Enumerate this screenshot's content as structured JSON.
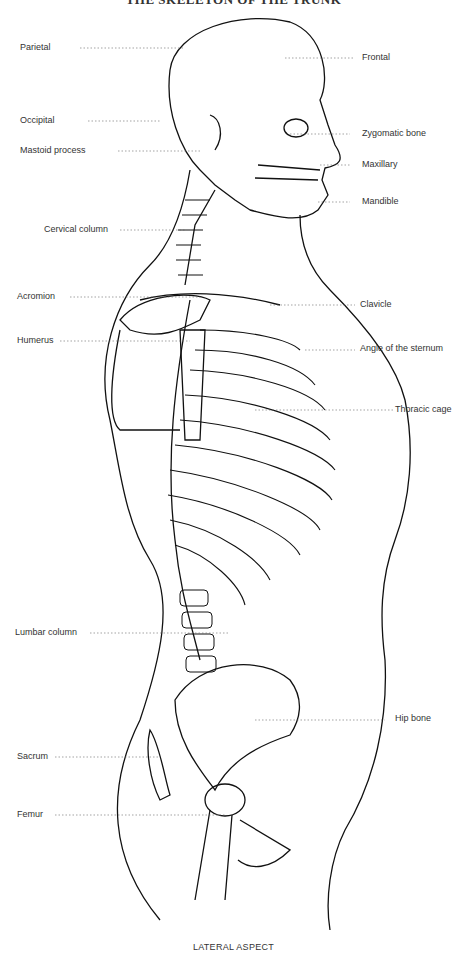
{
  "title": "THE SKELETON OF THE TRUNK",
  "caption": "LATERAL ASPECT",
  "left_labels": [
    {
      "text": "Parietal",
      "y": 48
    },
    {
      "text": "Occipital",
      "y": 121
    },
    {
      "text": "Mastoid process",
      "y": 151
    },
    {
      "text": "Cervical column",
      "y": 230
    },
    {
      "text": "Acromion",
      "y": 297
    },
    {
      "text": "Humerus",
      "y": 341
    },
    {
      "text": "Lumbar column",
      "y": 633
    },
    {
      "text": "Sacrum",
      "y": 757
    },
    {
      "text": "Femur",
      "y": 815
    }
  ],
  "right_labels": [
    {
      "text": "Frontal",
      "y": 58
    },
    {
      "text": "Zygomatic bone",
      "y": 134
    },
    {
      "text": "Maxillary",
      "y": 165
    },
    {
      "text": "Mandible",
      "y": 202
    },
    {
      "text": "Clavicle",
      "y": 302
    },
    {
      "text": "Angle of the sternum",
      "y": 345
    },
    {
      "text": "Thoracic cage",
      "y": 407
    },
    {
      "text": "Hip bone",
      "y": 716
    }
  ]
}
